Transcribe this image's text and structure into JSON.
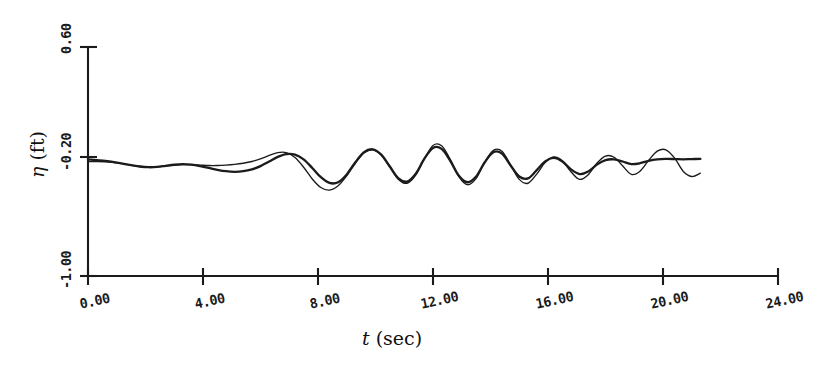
{
  "chart_data": {
    "type": "line",
    "title": "",
    "xlabel": "t (sec)",
    "xlabel_symbol": "t",
    "xlabel_unit": "(sec)",
    "ylabel": "η (ft)",
    "ylabel_symbol": "η",
    "ylabel_unit": "(ft)",
    "xlim": [
      0.0,
      24.0
    ],
    "ylim": [
      -1.0,
      0.6
    ],
    "xticks": [
      "0.00",
      "4.00",
      "8.00",
      "12.00",
      "16.00",
      "20.00",
      "24.00"
    ],
    "xtick_values": [
      0,
      4,
      8,
      12,
      16,
      20,
      24
    ],
    "yticks": [
      "0.60",
      "-0.20",
      "-1.00"
    ],
    "ytick_values": [
      0.6,
      -0.2,
      -1.0
    ],
    "grid": false,
    "legend": "none",
    "baseline": -0.2,
    "data_end_time": 21.3,
    "line_color": "#1b1b1b",
    "background_color": "#ffffff",
    "series": [
      {
        "name": "measured",
        "style": "thick-dotted",
        "x": [
          0.0,
          0.3,
          0.6,
          0.9,
          1.2,
          1.5,
          1.8,
          2.1,
          2.4,
          2.7,
          3.0,
          3.3,
          3.6,
          3.9,
          4.2,
          4.5,
          4.8,
          5.1,
          5.4,
          5.7,
          6.0,
          6.3,
          6.6,
          6.9,
          7.2,
          7.5,
          7.8,
          8.1,
          8.4,
          8.7,
          9.0,
          9.3,
          9.6,
          9.9,
          10.2,
          10.5,
          10.8,
          11.1,
          11.4,
          11.7,
          12.0,
          12.3,
          12.6,
          12.9,
          13.2,
          13.5,
          13.8,
          14.1,
          14.4,
          14.7,
          15.0,
          15.3,
          15.6,
          15.9,
          16.2,
          16.5,
          16.8,
          17.1,
          17.4,
          17.7,
          18.0,
          18.3,
          18.6,
          18.9,
          19.2,
          19.5,
          19.8,
          20.1,
          20.4,
          20.7,
          21.0,
          21.3
        ],
        "y": [
          -0.185,
          -0.19,
          -0.195,
          -0.205,
          -0.215,
          -0.225,
          -0.235,
          -0.24,
          -0.238,
          -0.23,
          -0.222,
          -0.218,
          -0.222,
          -0.232,
          -0.245,
          -0.258,
          -0.268,
          -0.272,
          -0.268,
          -0.255,
          -0.232,
          -0.2,
          -0.168,
          -0.148,
          -0.152,
          -0.185,
          -0.245,
          -0.31,
          -0.35,
          -0.345,
          -0.29,
          -0.205,
          -0.135,
          -0.115,
          -0.152,
          -0.235,
          -0.318,
          -0.34,
          -0.285,
          -0.18,
          -0.105,
          -0.112,
          -0.195,
          -0.3,
          -0.345,
          -0.305,
          -0.205,
          -0.135,
          -0.145,
          -0.228,
          -0.305,
          -0.318,
          -0.262,
          -0.2,
          -0.175,
          -0.2,
          -0.255,
          -0.288,
          -0.27,
          -0.222,
          -0.19,
          -0.185,
          -0.2,
          -0.218,
          -0.212,
          -0.195,
          -0.185,
          -0.182,
          -0.183,
          -0.185,
          -0.183,
          -0.182
        ]
      },
      {
        "name": "computed",
        "style": "thin-solid",
        "x": [
          0.0,
          0.3,
          0.6,
          0.9,
          1.2,
          1.5,
          1.8,
          2.1,
          2.4,
          2.7,
          3.0,
          3.3,
          3.6,
          3.9,
          4.2,
          4.5,
          4.8,
          5.1,
          5.4,
          5.7,
          6.0,
          6.3,
          6.6,
          6.9,
          7.2,
          7.5,
          7.8,
          8.1,
          8.4,
          8.7,
          9.0,
          9.3,
          9.6,
          9.9,
          10.2,
          10.5,
          10.8,
          11.1,
          11.4,
          11.7,
          12.0,
          12.3,
          12.6,
          12.9,
          13.2,
          13.5,
          13.8,
          14.1,
          14.4,
          14.7,
          15.0,
          15.3,
          15.6,
          15.9,
          16.2,
          16.5,
          16.8,
          17.1,
          17.4,
          17.7,
          18.0,
          18.3,
          18.6,
          18.9,
          19.2,
          19.5,
          19.8,
          20.1,
          20.4,
          20.7,
          21.0,
          21.3
        ],
        "y": [
          -0.2,
          -0.2,
          -0.202,
          -0.208,
          -0.215,
          -0.225,
          -0.235,
          -0.24,
          -0.238,
          -0.232,
          -0.226,
          -0.222,
          -0.222,
          -0.225,
          -0.228,
          -0.228,
          -0.225,
          -0.22,
          -0.212,
          -0.2,
          -0.182,
          -0.158,
          -0.138,
          -0.138,
          -0.172,
          -0.24,
          -0.322,
          -0.382,
          -0.4,
          -0.37,
          -0.3,
          -0.212,
          -0.14,
          -0.118,
          -0.155,
          -0.24,
          -0.325,
          -0.352,
          -0.295,
          -0.182,
          -0.088,
          -0.09,
          -0.185,
          -0.305,
          -0.362,
          -0.318,
          -0.205,
          -0.122,
          -0.128,
          -0.225,
          -0.325,
          -0.352,
          -0.29,
          -0.208,
          -0.168,
          -0.195,
          -0.272,
          -0.325,
          -0.292,
          -0.212,
          -0.162,
          -0.17,
          -0.232,
          -0.29,
          -0.268,
          -0.192,
          -0.128,
          -0.118,
          -0.175,
          -0.268,
          -0.305,
          -0.282
        ]
      }
    ]
  }
}
